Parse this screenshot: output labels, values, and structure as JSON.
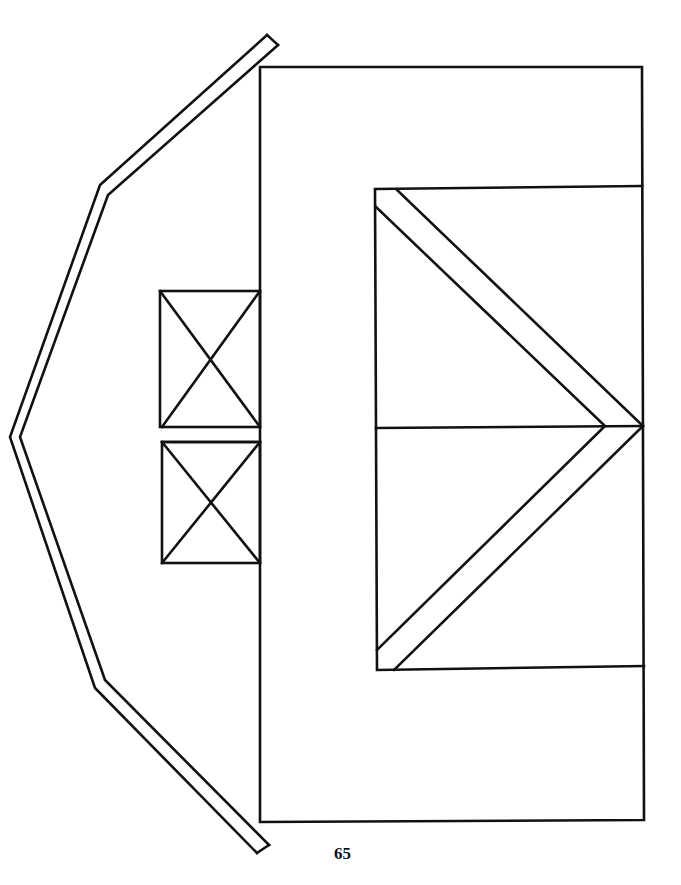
{
  "page": {
    "number": "65",
    "background": "#ffffff",
    "line_color": "#111111"
  },
  "diagram": {
    "type": "line-art pattern",
    "parts": [
      {
        "name": "roof-trim-strip",
        "description": "bent hexagonal-sided strip on the left"
      },
      {
        "name": "main-wall",
        "description": "large rectangle"
      },
      {
        "name": "window-upper",
        "description": "small rectangle with X cross"
      },
      {
        "name": "window-lower",
        "description": "small rectangle with X cross"
      },
      {
        "name": "barn-door",
        "description": "door rectangle split horizontally with chevron brace"
      }
    ]
  }
}
